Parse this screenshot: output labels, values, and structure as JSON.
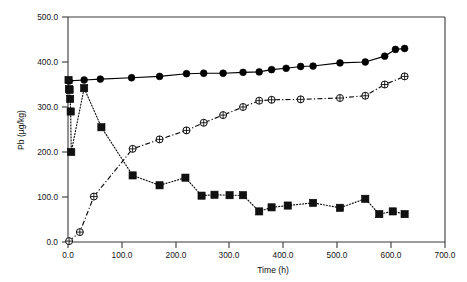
{
  "chart_data": {
    "type": "line",
    "title": "",
    "subtitle": "",
    "xlabel": "Time (h)",
    "ylabel": "Pb (µg/kg)",
    "xlim": [
      0.0,
      700.0
    ],
    "ylim": [
      0.0,
      500.0
    ],
    "xticks": [
      0.0,
      100.0,
      200.0,
      300.0,
      400.0,
      500.0,
      600.0,
      700.0
    ],
    "yticks": [
      0.0,
      100.0,
      200.0,
      300.0,
      400.0,
      500.0
    ],
    "xtick_labels": [
      "0.0",
      "100.0",
      "200.0",
      "300.0",
      "400.0",
      "500.0",
      "600.0",
      "700.0"
    ],
    "ytick_labels": [
      "0.0",
      "100.0",
      "200.0",
      "300.0",
      "400.0",
      "500.0"
    ],
    "grid": false,
    "legend": "none",
    "annotations": [],
    "series": [
      {
        "name": "filled-circle-solid",
        "marker": "filled-circle",
        "linestyle": "solid",
        "color": "#000000",
        "x": [
          2,
          30,
          60,
          118,
          170,
          220,
          252,
          288,
          325,
          355,
          378,
          405,
          432,
          455,
          505,
          552,
          588,
          608,
          625
        ],
        "y": [
          358,
          360,
          362,
          365,
          368,
          374,
          375,
          375,
          377,
          378,
          383,
          386,
          390,
          391,
          398,
          400,
          413,
          428,
          430
        ],
        "values": [
          358,
          360,
          362,
          365,
          368,
          374,
          375,
          375,
          377,
          378,
          383,
          386,
          390,
          391,
          398,
          400,
          413,
          428,
          430
        ]
      },
      {
        "name": "filled-square-dotted",
        "marker": "filled-square",
        "linestyle": "dotted",
        "color": "#111111",
        "x": [
          1,
          2,
          3,
          4,
          5,
          6,
          30,
          62,
          120,
          170,
          218,
          248,
          272,
          300,
          325,
          355,
          378,
          408,
          455,
          505,
          552,
          578,
          603,
          625
        ],
        "y": [
          360,
          340,
          338,
          318,
          290,
          200,
          342,
          255,
          148,
          126,
          143,
          103,
          105,
          104,
          104,
          68,
          77,
          81,
          87,
          76,
          96,
          62,
          68,
          62
        ],
        "values": [
          360,
          340,
          338,
          318,
          290,
          200,
          342,
          255,
          148,
          126,
          143,
          103,
          105,
          104,
          104,
          68,
          77,
          81,
          87,
          76,
          96,
          62,
          68,
          62
        ]
      },
      {
        "name": "crossed-circle-dashdot",
        "marker": "crossed-circle",
        "linestyle": "dash-dot",
        "color": "#0d0d0d",
        "x": [
          2,
          22,
          48,
          120,
          170,
          220,
          252,
          288,
          325,
          355,
          378,
          432,
          505,
          552,
          588,
          625
        ],
        "y": [
          2,
          22,
          101,
          207,
          228,
          248,
          265,
          282,
          300,
          314,
          316,
          317,
          320,
          325,
          350,
          368
        ],
        "values": [
          2,
          22,
          101,
          207,
          228,
          248,
          265,
          282,
          300,
          314,
          316,
          317,
          320,
          325,
          350,
          368
        ]
      }
    ]
  },
  "figure": {
    "background_color": "#ffffff",
    "axis_color": "#3a3a3a",
    "border": "left-bottom-top-right-partial"
  }
}
